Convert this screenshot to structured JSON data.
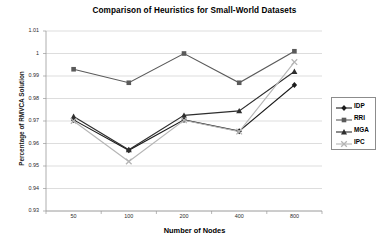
{
  "chart_data": {
    "type": "line",
    "title": "Comparison of Heuristics for Small-World Datasets",
    "xlabel": "Number of Nodes",
    "ylabel": "Percentage of RMVCA Solution",
    "categories": [
      "50",
      "100",
      "200",
      "400",
      "800"
    ],
    "yticks": [
      "1.01",
      "1",
      "0.99",
      "0.98",
      "0.97",
      "0.96",
      "0.95",
      "0.94",
      "0.93"
    ],
    "ytick_values": [
      1.01,
      1.0,
      0.99,
      0.98,
      0.97,
      0.96,
      0.95,
      0.94,
      0.93
    ],
    "ylim": [
      0.93,
      1.01
    ],
    "grid": true,
    "legend_position": "right",
    "series": [
      {
        "name": "IDP",
        "marker": "diamond",
        "color": "#1c1c1c",
        "values": [
          0.9705,
          0.957,
          0.9705,
          0.9655,
          0.986
        ]
      },
      {
        "name": "RRI",
        "marker": "square",
        "color": "#5a5a5a",
        "values": [
          0.993,
          0.987,
          1.0,
          0.987,
          1.001
        ]
      },
      {
        "name": "MGA",
        "marker": "triangle",
        "color": "#2e2e2e",
        "values": [
          0.972,
          0.9572,
          0.9725,
          0.9745,
          0.992
        ]
      },
      {
        "name": "IPC",
        "marker": "cross",
        "color": "#b5b5b5",
        "values": [
          0.97,
          0.952,
          0.9703,
          0.9653,
          0.9962
        ]
      }
    ]
  },
  "legend": {
    "items": [
      {
        "label": "IDP"
      },
      {
        "label": "RRI"
      },
      {
        "label": "MGA"
      },
      {
        "label": "IPC"
      }
    ]
  },
  "colors": {
    "grid": "#cfcfcf",
    "axis": "#9a9a9a",
    "background": "#ffffff",
    "text": "#000000"
  }
}
